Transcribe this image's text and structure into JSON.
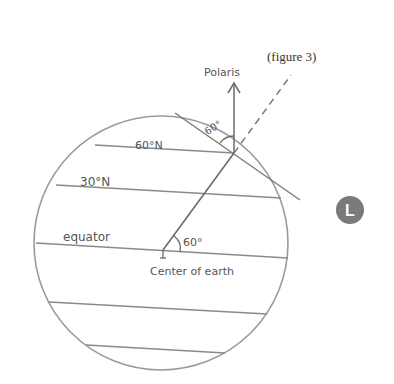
{
  "figure": {
    "caption": "(figure 3)",
    "star_label": "Polaris",
    "latitude_labels": {
      "lat60": "60°N",
      "lat30": "30°N",
      "equator": "equator"
    },
    "center_label": "Center of earth",
    "angles": {
      "observer_angle": "60°",
      "center_angle": "60°"
    },
    "badge": "L"
  },
  "colors": {
    "line": "#8a8a8a",
    "dark_line": "#6b6b6b",
    "badge_fill": "#7a7a7a"
  }
}
